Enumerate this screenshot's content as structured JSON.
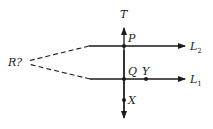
{
  "diagram": {
    "type": "geometry-lines",
    "labels": {
      "T": "T",
      "P": "P",
      "Q": "Q",
      "Y": "Y",
      "X": "X",
      "R": "R?",
      "L2_main": "L",
      "L2_sub": "2",
      "L1_main": "L",
      "L1_sub": "1"
    },
    "lines": [
      {
        "name": "transversal",
        "label": "T",
        "direction": "vertical",
        "arrows": "both"
      },
      {
        "name": "L2",
        "label": "L2",
        "direction": "horizontal",
        "arrow": "right",
        "passes_through": "P"
      },
      {
        "name": "L1",
        "label": "L1",
        "direction": "horizontal",
        "arrow": "right",
        "passes_through": [
          "Q",
          "Y"
        ]
      }
    ],
    "points": [
      "P",
      "Q",
      "Y",
      "X"
    ],
    "dashed_extensions": {
      "meet_at": "R?",
      "from": [
        "L2",
        "L1"
      ]
    },
    "colors": {
      "ink": "#1a1a1a",
      "background": "#ffffff"
    }
  }
}
